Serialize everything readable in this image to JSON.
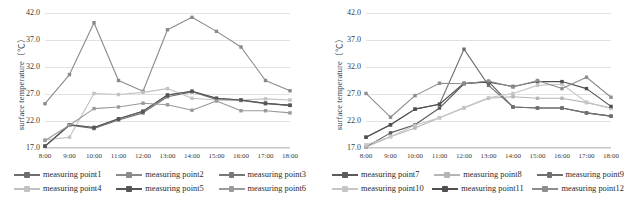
{
  "figure": {
    "caption": "",
    "y_axis_title": "surface temperature（℃）"
  },
  "chart_data": [
    {
      "type": "line",
      "panel": "left",
      "title": "",
      "xlabel": "",
      "ylabel": "surface temperature（℃）",
      "ylim": [
        17.0,
        42.0
      ],
      "yticks": [
        "17.0",
        "22.0",
        "27.0",
        "32.0",
        "37.0",
        "42.0"
      ],
      "grid": true,
      "legend_position": "bottom",
      "categories": [
        "8:00",
        "9:00",
        "10:00",
        "11:00",
        "12:00",
        "13:00",
        "14:00",
        "15:00",
        "16:00",
        "17:00",
        "18:00"
      ],
      "series": [
        {
          "name": "measuring point1",
          "color": "#6e6e6e",
          "values": [
            17.4,
            21.2,
            20.6,
            22.2,
            23.5,
            26.5,
            27.4,
            26.0,
            25.8,
            25.2,
            24.9
          ]
        },
        {
          "name": "measuring point2",
          "color": "#8a8a8a",
          "values": [
            25.2,
            30.6,
            40.2,
            29.5,
            27.5,
            38.9,
            41.2,
            38.6,
            35.7,
            29.5,
            27.6
          ]
        },
        {
          "name": "measuring point3",
          "color": "#777777",
          "values": [
            17.3,
            21.3,
            20.8,
            22.4,
            23.8,
            26.8,
            27.5,
            26.2,
            25.9,
            25.3,
            24.9
          ]
        },
        {
          "name": "measuring point4",
          "color": "#c2c2c2",
          "values": [
            18.5,
            19.0,
            27.1,
            26.9,
            27.3,
            28.0,
            26.2,
            25.9,
            25.9,
            26.1,
            25.9
          ]
        },
        {
          "name": "measuring point5",
          "color": "#555555",
          "values": [
            17.3,
            21.3,
            20.8,
            22.4,
            23.8,
            26.8,
            27.5,
            26.2,
            25.9,
            25.3,
            24.9
          ]
        },
        {
          "name": "measuring point6",
          "color": "#9a9a9a",
          "values": [
            18.4,
            21.2,
            24.3,
            24.6,
            25.3,
            25.0,
            24.0,
            25.7,
            23.9,
            23.9,
            23.5
          ]
        }
      ]
    },
    {
      "type": "line",
      "panel": "right",
      "title": "",
      "xlabel": "",
      "ylabel": "surface temperature（℃）",
      "ylim": [
        17.0,
        42.0
      ],
      "yticks": [
        "17.0",
        "22.0",
        "27.0",
        "32.0",
        "37.0",
        "42.0"
      ],
      "grid": true,
      "legend_position": "bottom",
      "categories": [
        "8:00",
        "9:00",
        "10:00",
        "11:00",
        "12:00",
        "13:00",
        "14:00",
        "15:00",
        "16:00",
        "17:00",
        "18:00"
      ],
      "series": [
        {
          "name": "measuring point7",
          "color": "#5a5a5a",
          "values": [
            17.2,
            19.8,
            21.3,
            24.4,
            28.9,
            29.3,
            24.6,
            24.4,
            24.4,
            23.5,
            22.9
          ]
        },
        {
          "name": "measuring point8",
          "color": "#b5b5b5",
          "values": [
            17.2,
            19.1,
            20.7,
            22.6,
            24.4,
            26.2,
            26.5,
            26.2,
            26.2,
            25.4,
            24.4
          ]
        },
        {
          "name": "measuring point9",
          "color": "#6f6f6f",
          "values": [
            19.0,
            21.3,
            24.2,
            25.1,
            35.3,
            28.6,
            24.6,
            24.4,
            24.4,
            23.5,
            22.9
          ]
        },
        {
          "name": "measuring point10",
          "color": "#c6c6c6",
          "values": [
            17.6,
            19.1,
            21.2,
            22.6,
            24.5,
            26.3,
            27.1,
            28.6,
            28.8,
            25.5,
            24.3
          ]
        },
        {
          "name": "measuring point11",
          "color": "#4f4f4f",
          "values": [
            19.0,
            21.3,
            24.2,
            25.1,
            29.0,
            29.2,
            28.4,
            29.3,
            29.3,
            28.0,
            24.7
          ]
        },
        {
          "name": "measuring point12",
          "color": "#8d8d8d",
          "values": [
            27.1,
            22.7,
            26.7,
            29.0,
            28.9,
            29.4,
            28.3,
            29.5,
            28.0,
            30.1,
            26.4
          ]
        }
      ]
    }
  ],
  "legends": {
    "left": [
      [
        {
          "label": "measuring point1",
          "color": "#6e6e6e"
        },
        {
          "label": "measuring point2",
          "color": "#8a8a8a"
        },
        {
          "label": "measuring point3",
          "color": "#777777"
        }
      ],
      [
        {
          "label": "measuring point4",
          "color": "#c2c2c2"
        },
        {
          "label": "measuring point5",
          "color": "#555555"
        },
        {
          "label": "measuring point6",
          "color": "#9a9a9a"
        }
      ]
    ],
    "right": [
      [
        {
          "label": "measuring point7",
          "color": "#5a5a5a"
        },
        {
          "label": "measuring point8",
          "color": "#b5b5b5"
        },
        {
          "label": "measuring point9",
          "color": "#6f6f6f"
        }
      ],
      [
        {
          "label": "measuring point10",
          "color": "#c6c6c6"
        },
        {
          "label": "measuring point11",
          "color": "#4f4f4f"
        },
        {
          "label": "measuring point12",
          "color": "#8d8d8d"
        }
      ]
    ]
  }
}
